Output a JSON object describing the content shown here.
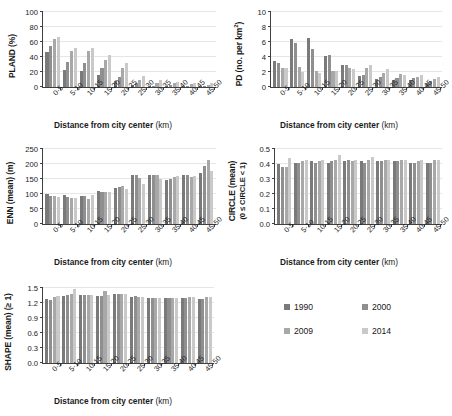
{
  "figure": {
    "categories": [
      "0-5",
      "5-10",
      "10-15",
      "15-20",
      "20-25",
      "25-30",
      "30-35",
      "35-40",
      "40-45",
      "45-50"
    ],
    "xlabel_bold": "Distance from city center",
    "xlabel_unit": "(km)",
    "series_names": [
      "1990",
      "2000",
      "2009",
      "2014"
    ],
    "series_colors": [
      "#7a7a7a",
      "#8f8f8f",
      "#a8a8a8",
      "#c9c9c9"
    ]
  },
  "legend": {
    "position": "bottom-right",
    "items": [
      {
        "label": "1990",
        "color": "#7a7a7a"
      },
      {
        "label": "2000",
        "color": "#8f8f8f"
      },
      {
        "label": "2009",
        "color": "#a8a8a8"
      },
      {
        "label": "2014",
        "color": "#c9c9c9"
      }
    ]
  },
  "chart_data": [
    {
      "id": "pland",
      "type": "bar",
      "title": "",
      "ylabel": "PLAND (%)",
      "xlabel": "Distance from city center (km)",
      "categories": [
        "0-5",
        "5-10",
        "10-15",
        "15-20",
        "20-25",
        "25-30",
        "30-35",
        "35-40",
        "40-45",
        "45-50"
      ],
      "yticks": [
        "0",
        "20",
        "40",
        "60",
        "80",
        "100"
      ],
      "ylim": [
        0,
        100
      ],
      "grid": true,
      "legend": "1990, 2000, 2009, 2014",
      "series": [
        {
          "name": "1990",
          "values": [
            47,
            23,
            21,
            16,
            8,
            3,
            1,
            2,
            1,
            1
          ]
        },
        {
          "name": "2000",
          "values": [
            55,
            33,
            32,
            26,
            13,
            5,
            2,
            3,
            2,
            2
          ]
        },
        {
          "name": "2009",
          "values": [
            64,
            48,
            48,
            36,
            25,
            9,
            5,
            5,
            4,
            3
          ]
        },
        {
          "name": "2014",
          "values": [
            67,
            52,
            52,
            43,
            32,
            15,
            10,
            7,
            5,
            5
          ]
        }
      ]
    },
    {
      "id": "pd",
      "type": "bar",
      "title": "",
      "ylabel": "PD (no. per km2)",
      "xlabel": "Distance from city center (km)",
      "categories": [
        "0-5",
        "5-10",
        "10-15",
        "15-20",
        "20-25",
        "25-30",
        "30-35",
        "35-40",
        "40-45",
        "45-50"
      ],
      "yticks": [
        "0",
        "2",
        "4",
        "6",
        "8",
        "10"
      ],
      "ylim": [
        0,
        10
      ],
      "grid": true,
      "legend": "1990, 2000, 2009, 2014",
      "series": [
        {
          "name": "1990",
          "values": [
            3.5,
            6.4,
            6.6,
            4.2,
            3.0,
            1.5,
            1.1,
            1.0,
            0.9,
            0.6
          ]
        },
        {
          "name": "2000",
          "values": [
            3.2,
            5.9,
            5.1,
            4.3,
            3.0,
            1.6,
            1.4,
            1.2,
            1.2,
            0.8
          ]
        },
        {
          "name": "2009",
          "values": [
            2.6,
            2.7,
            2.2,
            2.2,
            2.5,
            2.5,
            1.9,
            1.8,
            1.4,
            1.1
          ]
        },
        {
          "name": "2014",
          "values": [
            2.5,
            2.0,
            1.9,
            2.1,
            2.4,
            2.9,
            2.4,
            1.6,
            1.6,
            1.4
          ]
        }
      ]
    },
    {
      "id": "enn",
      "type": "bar",
      "title": "",
      "ylabel": "ENN (mean) (m)",
      "xlabel": "Distance from city center (km)",
      "categories": [
        "0-5",
        "5-10",
        "10-15",
        "15-20",
        "20-25",
        "25-30",
        "30-35",
        "35-40",
        "40-45",
        "45-50"
      ],
      "yticks": [
        "0",
        "50",
        "100",
        "150",
        "200",
        "250"
      ],
      "ylim": [
        0,
        250
      ],
      "grid": true,
      "legend": "1990, 2000, 2009, 2014",
      "series": [
        {
          "name": "1990",
          "values": [
            101,
            98,
            95,
            110,
            120,
            163,
            163,
            146,
            164,
            170
          ]
        },
        {
          "name": "2000",
          "values": [
            92,
            89,
            92,
            108,
            123,
            163,
            163,
            150,
            164,
            192
          ]
        },
        {
          "name": "2009",
          "values": [
            92,
            88,
            85,
            106,
            126,
            154,
            162,
            158,
            156,
            215
          ]
        },
        {
          "name": "2014",
          "values": [
            90,
            88,
            97,
            108,
            118,
            135,
            150,
            159,
            161,
            176
          ]
        }
      ]
    },
    {
      "id": "circle",
      "type": "bar",
      "title": "",
      "ylabel": "CIRCLE (mean)",
      "ylabel_sub": "(0 ≤ CIRCLE < 1)",
      "xlabel": "Distance from city center (km)",
      "categories": [
        "0-5",
        "5-10",
        "10-15",
        "15-20",
        "20-25",
        "25-30",
        "30-35",
        "35-40",
        "40-45",
        "45-50"
      ],
      "yticks": [
        "0.0",
        "0.1",
        "0.2",
        "0.3",
        "0.4",
        "0.5"
      ],
      "ylim": [
        0,
        0.5
      ],
      "grid": true,
      "legend": "1990, 2000, 2009, 2014",
      "series": [
        {
          "name": "1990",
          "values": [
            0.4,
            0.41,
            0.42,
            0.41,
            0.42,
            0.42,
            0.42,
            0.42,
            0.41,
            0.41
          ]
        },
        {
          "name": "2000",
          "values": [
            0.38,
            0.41,
            0.41,
            0.42,
            0.43,
            0.41,
            0.42,
            0.42,
            0.41,
            0.41
          ]
        },
        {
          "name": "2009",
          "values": [
            0.38,
            0.42,
            0.42,
            0.43,
            0.42,
            0.43,
            0.43,
            0.43,
            0.42,
            0.43
          ]
        },
        {
          "name": "2014",
          "values": [
            0.44,
            0.43,
            0.43,
            0.46,
            0.43,
            0.45,
            0.43,
            0.43,
            0.43,
            0.43
          ]
        }
      ]
    },
    {
      "id": "shape",
      "type": "bar",
      "title": "",
      "ylabel": "SHAPE (mean) (≥ 1)",
      "xlabel": "Distance from city center (km)",
      "categories": [
        "0-5",
        "5-10",
        "10-15",
        "15-20",
        "20-25",
        "25-30",
        "30-35",
        "35-40",
        "40-45",
        "45-50"
      ],
      "yticks": [
        "0.0",
        "0.3",
        "0.6",
        "0.9",
        "1.2",
        "1.5"
      ],
      "ylim": [
        0,
        1.5
      ],
      "grid": true,
      "legend": "1990, 2000, 2009, 2014",
      "series": [
        {
          "name": "1990",
          "values": [
            1.29,
            1.35,
            1.37,
            1.34,
            1.38,
            1.33,
            1.3,
            1.3,
            1.31,
            1.29
          ]
        },
        {
          "name": "2000",
          "values": [
            1.27,
            1.36,
            1.37,
            1.35,
            1.39,
            1.34,
            1.3,
            1.31,
            1.31,
            1.29
          ]
        },
        {
          "name": "2009",
          "values": [
            1.33,
            1.38,
            1.37,
            1.45,
            1.38,
            1.33,
            1.31,
            1.31,
            1.32,
            1.32
          ]
        },
        {
          "name": "2014",
          "values": [
            1.34,
            1.49,
            1.37,
            1.37,
            1.38,
            1.33,
            1.31,
            1.31,
            1.32,
            1.33
          ]
        }
      ]
    }
  ]
}
